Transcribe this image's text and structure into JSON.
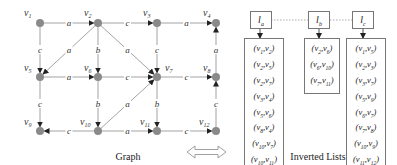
{
  "colors": {
    "node": "#8a8a8a",
    "edge": "#999999",
    "arrow": "#222222",
    "box_border": "#777777"
  },
  "graph": {
    "caption": "Graph",
    "nodes": [
      {
        "id": "v1",
        "x": 40,
        "y": 23,
        "lx": 24,
        "ly": 16
      },
      {
        "id": "v2",
        "x": 98,
        "y": 23,
        "lx": 84,
        "ly": 16
      },
      {
        "id": "v3",
        "x": 157,
        "y": 23,
        "lx": 143,
        "ly": 16
      },
      {
        "id": "v4",
        "x": 216,
        "y": 23,
        "lx": 203,
        "ly": 16
      },
      {
        "id": "v5",
        "x": 40,
        "y": 77,
        "lx": 24,
        "ly": 71
      },
      {
        "id": "v6",
        "x": 98,
        "y": 77,
        "lx": 84,
        "ly": 71
      },
      {
        "id": "v7",
        "x": 157,
        "y": 77,
        "lx": 165,
        "ly": 71
      },
      {
        "id": "v8",
        "x": 216,
        "y": 77,
        "lx": 203,
        "ly": 71
      },
      {
        "id": "v9",
        "x": 40,
        "y": 131,
        "lx": 24,
        "ly": 125
      },
      {
        "id": "v10",
        "x": 98,
        "y": 131,
        "lx": 80,
        "ly": 125
      },
      {
        "id": "v11",
        "x": 157,
        "y": 131,
        "lx": 140,
        "ly": 125
      },
      {
        "id": "v12",
        "x": 216,
        "y": 131,
        "lx": 199,
        "ly": 125
      }
    ],
    "edges": [
      {
        "from": "v1",
        "to": "v2",
        "label": "a"
      },
      {
        "from": "v2",
        "to": "v3",
        "label": "c"
      },
      {
        "from": "v3",
        "to": "v4",
        "label": "a"
      },
      {
        "from": "v1",
        "to": "v5",
        "label": "c"
      },
      {
        "from": "v2",
        "to": "v5",
        "label": "a"
      },
      {
        "from": "v2",
        "to": "v6",
        "label": "b"
      },
      {
        "from": "v2",
        "to": "v7",
        "label": "a"
      },
      {
        "from": "v3",
        "to": "v7",
        "label": "c"
      },
      {
        "from": "v8",
        "to": "v4",
        "label": "a"
      },
      {
        "from": "v5",
        "to": "v6",
        "label": "a"
      },
      {
        "from": "v6",
        "to": "v7",
        "label": "c"
      },
      {
        "from": "v7",
        "to": "v8",
        "label": "c"
      },
      {
        "from": "v5",
        "to": "v9",
        "label": "c"
      },
      {
        "from": "v6",
        "to": "v10",
        "label": "b"
      },
      {
        "from": "v10",
        "to": "v7",
        "label": "a"
      },
      {
        "from": "v7",
        "to": "v11",
        "label": "b"
      },
      {
        "from": "v12",
        "to": "v8",
        "label": "c"
      },
      {
        "from": "v10",
        "to": "v9",
        "label": "c"
      },
      {
        "from": "v10",
        "to": "v11",
        "label": "a"
      },
      {
        "from": "v11",
        "to": "v12",
        "label": "c"
      }
    ]
  },
  "inverted_lists": {
    "caption": "Inverted Lists",
    "lists": [
      {
        "header": "la",
        "header_main": "l",
        "header_sub": "a",
        "items": [
          "(v1,v2)",
          "(v2,v5)",
          "(v2,v7)",
          "(v3,v4)",
          "(v5,v6)",
          "(v8,v4)",
          "(v10,v7)",
          "(v10,v11)"
        ]
      },
      {
        "header": "lb",
        "header_main": "l",
        "header_sub": "b",
        "items": [
          "(v2,v6)",
          "(v6,v10)",
          "(v7,v11)"
        ]
      },
      {
        "header": "lc",
        "header_main": "l",
        "header_sub": "c",
        "items": [
          "(v1,v5)",
          "(v2,v3)",
          "(v3,v7)",
          "(v5,v9)",
          "(v6,v7)",
          "(v7,v8)",
          "(v10,v9)",
          "(v11,v12)",
          "(v12,v8)"
        ]
      }
    ]
  },
  "connector": {
    "type": "double-arrow"
  }
}
